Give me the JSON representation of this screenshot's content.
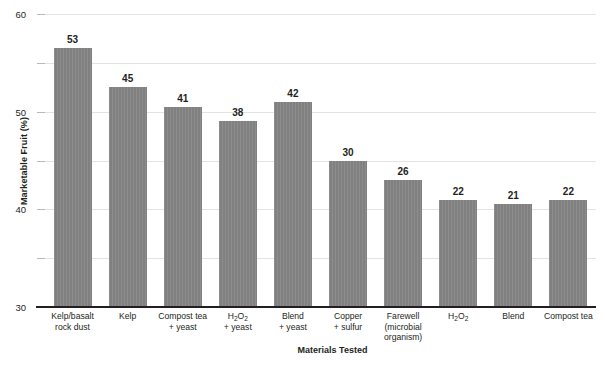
{
  "chart_data": {
    "type": "bar",
    "title": "",
    "xlabel": "Materials Tested",
    "ylabel": "Marketable Fruit (%)",
    "ylim": [
      0,
      60
    ],
    "yticks": [
      0,
      10,
      20,
      30,
      40,
      50,
      60
    ],
    "grid": true,
    "legend": null,
    "bar_color": "#808080",
    "categories": [
      "Kelp/basalt rock dust",
      "Kelp",
      "Compost tea + yeast",
      "H2O2 + yeast",
      "Blend + yeast",
      "Copper + sulfur",
      "Farewell (microbial organism)",
      "H2O2",
      "Blend",
      "Compost tea"
    ],
    "category_lines": [
      [
        "Kelp/basalt",
        "rock dust"
      ],
      [
        "Kelp"
      ],
      [
        "Compost tea",
        "+ yeast"
      ],
      [
        "H<sub>2</sub>O<sub>2</sub>",
        "+ yeast"
      ],
      [
        "Blend",
        "+ yeast"
      ],
      [
        "Copper",
        "+ sulfur"
      ],
      [
        "Farewell",
        "(microbial",
        "organism)"
      ],
      [
        "H<sub>2</sub>O<sub>2</sub>"
      ],
      [
        "Blend"
      ],
      [
        "Compost tea"
      ]
    ],
    "values": [
      53,
      45,
      41,
      38,
      42,
      30,
      26,
      22,
      21,
      22
    ],
    "value_labels": [
      "53",
      "45",
      "41",
      "38",
      "42",
      "30",
      "26",
      "22",
      "21",
      "22"
    ]
  }
}
